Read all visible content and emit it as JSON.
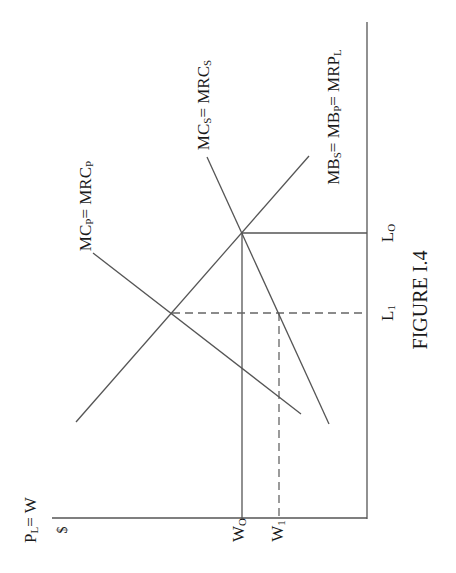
{
  "figure": {
    "caption": "FIGURE I.4",
    "colors": {
      "background": "#ffffff",
      "line": "#555555",
      "text": "#1a1a1a"
    },
    "axes": {
      "vertical": {
        "label_main": "P",
        "label_sub": "L",
        "label_tail": "= W",
        "unit": "$"
      }
    },
    "ticks": {
      "w0": {
        "main": "W",
        "sub": "O"
      },
      "w1": {
        "main": "W",
        "sub": "1"
      },
      "l0": {
        "main": "L",
        "sub": "O"
      },
      "l1": {
        "main": "L",
        "sub": "1"
      }
    },
    "curves": {
      "mc_private": {
        "p1": "MC",
        "s1": "P",
        "p2": "= MRC",
        "s2": "P"
      },
      "mc_social": {
        "p1": "MC",
        "s1": "S",
        "p2": "= MRC",
        "s2": "S"
      },
      "mb": {
        "p1": "MB",
        "s1": "S",
        "p2": "= MB",
        "s2": "P",
        "p3": "= MRP",
        "s3": "L"
      }
    },
    "guides": {
      "w0_l0": "solid",
      "w1_l1": "dashed"
    }
  }
}
